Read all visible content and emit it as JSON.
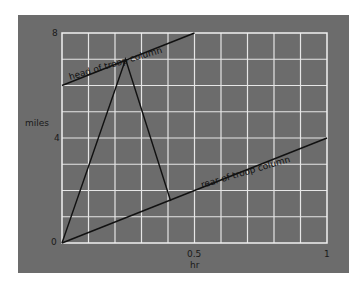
{
  "chart_data": {
    "type": "line",
    "title": "",
    "xlabel": "hr",
    "ylabel": "miles",
    "xlim": [
      0,
      1
    ],
    "ylim": [
      0,
      8
    ],
    "grid": true,
    "x_ticks": [
      "0.5",
      "1"
    ],
    "y_ticks": [
      "0",
      "4",
      "8"
    ],
    "x_grid_divisions": 10,
    "y_grid_divisions": 8,
    "series": [
      {
        "name": "head of troop column",
        "x": [
          0,
          0.5
        ],
        "y": [
          6,
          8
        ]
      },
      {
        "name": "rear of troop column",
        "x": [
          0,
          1
        ],
        "y": [
          0,
          4
        ]
      },
      {
        "name": "messenger path",
        "x": [
          0,
          0.24,
          0.41
        ],
        "y": [
          0,
          7.0,
          1.6
        ]
      }
    ],
    "annotations": [
      "head of troop column",
      "rear of troop column"
    ],
    "colors": {
      "panel": "#6c6c6c",
      "grid": "#e8e8e8",
      "line": "#111111"
    }
  },
  "labels": {
    "y0": "0",
    "y4": "4",
    "y8": "8",
    "x05": "0.5",
    "x1": "1",
    "xlabel": "hr",
    "ylabel": "miles",
    "head": "head of troop column",
    "rear": "rear of troop column"
  }
}
